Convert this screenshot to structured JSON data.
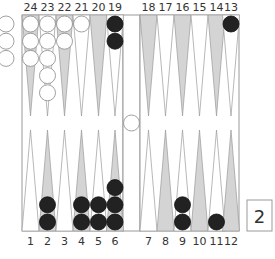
{
  "board": {
    "top_labels": [
      "24",
      "23",
      "22",
      "21",
      "20",
      "19",
      "18",
      "17",
      "16",
      "15",
      "14",
      "13"
    ],
    "bottom_labels": [
      "1",
      "2",
      "3",
      "4",
      "5",
      "6",
      "7",
      "8",
      "9",
      "10",
      "11",
      "12"
    ],
    "colors": {
      "light_point": "#ffffff",
      "dark_point": "#d4d4d4",
      "point_stroke": "#999999",
      "frame": "#999999",
      "white_checker": "#ffffff",
      "white_checker_stroke": "#888888",
      "black_checker": "#222222"
    },
    "points": [
      {
        "point": 24,
        "color": "white",
        "count": 3
      },
      {
        "point": 23,
        "color": "white",
        "count": 5
      },
      {
        "point": 22,
        "color": "white",
        "count": 2
      },
      {
        "point": 21,
        "color": "white",
        "count": 1
      },
      {
        "point": 20,
        "color": "none",
        "count": 0
      },
      {
        "point": 19,
        "color": "black",
        "count": 2
      },
      {
        "point": 18,
        "color": "none",
        "count": 0
      },
      {
        "point": 17,
        "color": "none",
        "count": 0
      },
      {
        "point": 16,
        "color": "none",
        "count": 0
      },
      {
        "point": 15,
        "color": "none",
        "count": 0
      },
      {
        "point": 14,
        "color": "none",
        "count": 0
      },
      {
        "point": 13,
        "color": "black",
        "count": 1
      },
      {
        "point": 1,
        "color": "none",
        "count": 0
      },
      {
        "point": 2,
        "color": "black",
        "count": 2
      },
      {
        "point": 3,
        "color": "none",
        "count": 0
      },
      {
        "point": 4,
        "color": "black",
        "count": 2
      },
      {
        "point": 5,
        "color": "black",
        "count": 2
      },
      {
        "point": 6,
        "color": "black",
        "count": 3
      },
      {
        "point": 7,
        "color": "none",
        "count": 0
      },
      {
        "point": 8,
        "color": "none",
        "count": 0
      },
      {
        "point": 9,
        "color": "black",
        "count": 2
      },
      {
        "point": 10,
        "color": "none",
        "count": 0
      },
      {
        "point": 11,
        "color": "black",
        "count": 1
      },
      {
        "point": 12,
        "color": "none",
        "count": 0
      }
    ],
    "bar": {
      "white": 1,
      "black": 0
    },
    "off": {
      "white": 3,
      "black": 0
    }
  },
  "cube": {
    "value": "2"
  }
}
